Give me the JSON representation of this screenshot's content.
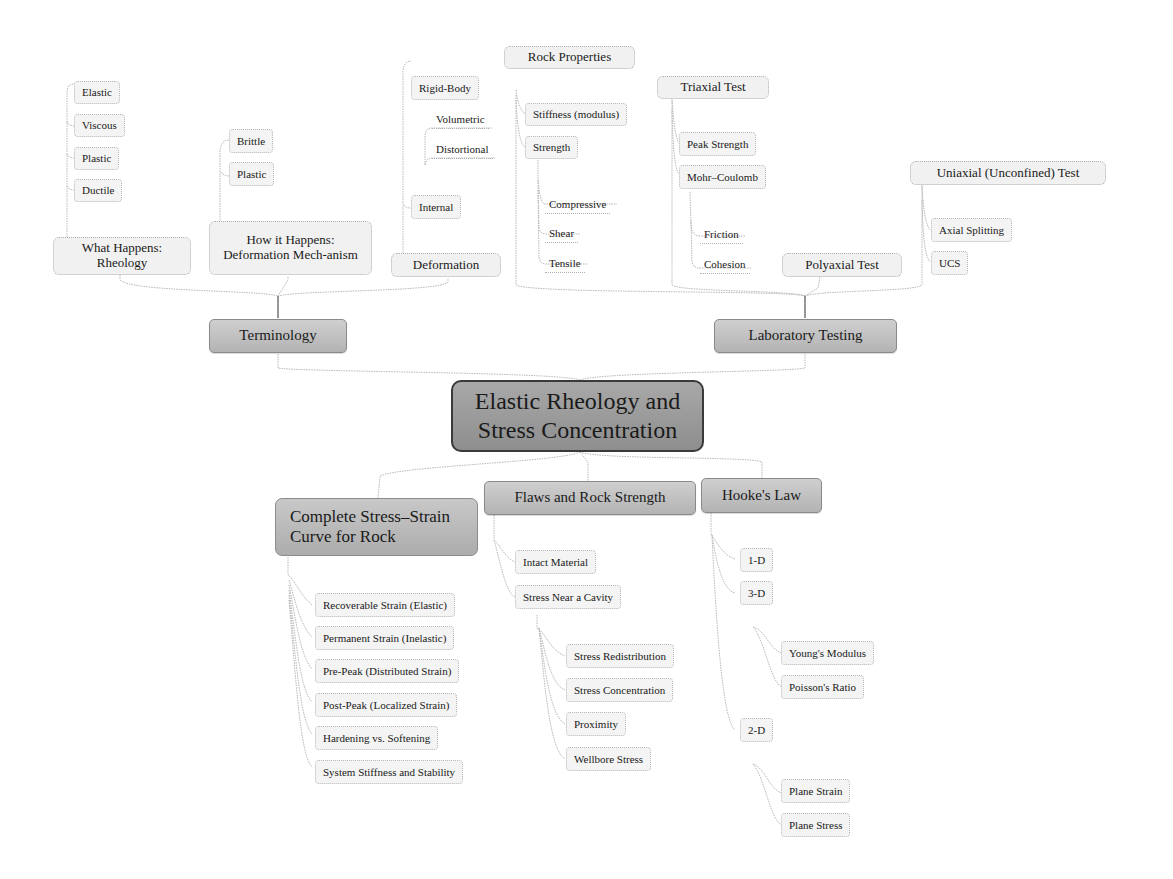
{
  "root": {
    "label": "Elastic Rheology and Stress Concentration"
  },
  "terminology": {
    "label": "Terminology",
    "what_happens": {
      "label": "What Happens: Rheology",
      "items": [
        "Elastic",
        "Viscous",
        "Plastic",
        "Ductile"
      ]
    },
    "how_it_happens": {
      "label": "How it Happens: Deformation Mech-anism",
      "items": [
        "Brittle",
        "Plastic"
      ]
    },
    "deformation": {
      "label": "Deformation",
      "items": [
        "Rigid-Body",
        "Internal"
      ],
      "sub_items": [
        "Volumetric",
        "Distortional"
      ]
    }
  },
  "laboratory_testing": {
    "label": "Laboratory Testing",
    "rock_properties": {
      "label": "Rock Properties",
      "items": [
        "Stiffness (modulus)",
        "Strength"
      ],
      "strength_items": [
        "Compressive",
        "Shear",
        "Tensile"
      ]
    },
    "triaxial_test": {
      "label": "Triaxial Test",
      "items": [
        "Peak Strength",
        "Mohr–Coulomb"
      ],
      "mohr_items": [
        "Friction",
        "Cohesion"
      ]
    },
    "polyaxial_test": {
      "label": "Polyaxial Test"
    },
    "uniaxial_test": {
      "label": "Uniaxial (Unconfined) Test",
      "items": [
        "Axial Splitting",
        "UCS"
      ]
    }
  },
  "complete_curve": {
    "label": "Complete Stress–Strain Curve for Rock",
    "items": [
      "Recoverable Strain (Elastic)",
      "Permanent Strain (Inelastic)",
      "Pre-Peak (Distributed Strain)",
      "Post-Peak (Localized Strain)",
      "Hardening vs. Softening",
      "System Stiffness and Stability"
    ]
  },
  "flaws": {
    "label": "Flaws and Rock Strength",
    "items": [
      "Intact Material",
      "Stress Near a Cavity"
    ],
    "cavity_items": [
      "Stress Redistribution",
      "Stress Concentration",
      "Proximity",
      "Wellbore Stress"
    ]
  },
  "hookes_law": {
    "label": "Hooke's Law",
    "items": [
      "1-D",
      "3-D",
      "2-D"
    ],
    "three_d_items": [
      "Young's Modulus",
      "Poisson's Ratio"
    ],
    "two_d_items": [
      "Plane Strain",
      "Plane Stress"
    ]
  },
  "colors": {
    "root_fill": "#9a9a9a",
    "branch_fill": "#bcbcbc",
    "leaf_fill": "#f4f4f4",
    "connector": "#b5b5b5"
  }
}
